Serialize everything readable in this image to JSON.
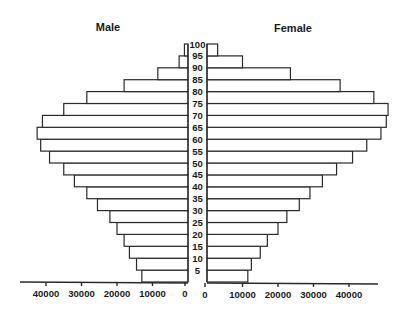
{
  "chart_data": {
    "type": "bar",
    "subtype": "population-pyramid",
    "title": "",
    "left_label": "Male",
    "right_label": "Female",
    "xlabel": "",
    "ylabel": "",
    "age_groups": [
      "0-5",
      "5-10",
      "10-15",
      "15-20",
      "20-25",
      "25-30",
      "30-35",
      "35-40",
      "40-45",
      "45-50",
      "50-55",
      "55-60",
      "60-65",
      "65-70",
      "70-75",
      "75-80",
      "80-85",
      "85-90",
      "90-95",
      "95-100"
    ],
    "age_tick_labels": [
      "5",
      "10",
      "15",
      "20",
      "25",
      "30",
      "35",
      "40",
      "45",
      "50",
      "55",
      "60",
      "65",
      "70",
      "75",
      "80",
      "85",
      "90",
      "95",
      "100"
    ],
    "series": [
      {
        "name": "Male",
        "side": "left",
        "values": [
          13000,
          14500,
          16500,
          18000,
          20000,
          22000,
          25500,
          28500,
          32000,
          35000,
          39000,
          41500,
          42500,
          41000,
          35000,
          28500,
          18000,
          8500,
          2500,
          1000
        ]
      },
      {
        "name": "Female",
        "side": "right",
        "values": [
          11500,
          12500,
          15000,
          17000,
          20000,
          22500,
          26000,
          29000,
          32500,
          36500,
          41000,
          45000,
          49000,
          50500,
          51000,
          47000,
          37500,
          23500,
          10000,
          3000
        ]
      }
    ],
    "x_tick_labels_left": [
      "40000",
      "30000",
      "20000",
      "10000",
      "0"
    ],
    "x_tick_labels_right": [
      "0",
      "10000",
      "20000",
      "30000",
      "40000"
    ],
    "x_ticks": [
      0,
      10000,
      20000,
      30000,
      40000
    ],
    "xlim": [
      0,
      50000
    ],
    "grid": false,
    "legend": "none"
  }
}
